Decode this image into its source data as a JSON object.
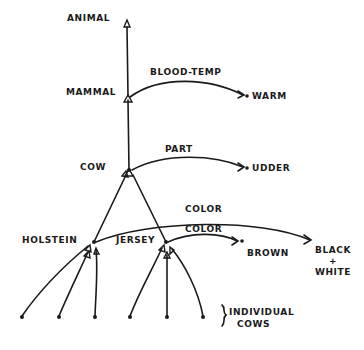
{
  "diagram": {
    "type": "semantic-network",
    "style": "hand-drawn",
    "nodes": {
      "animal": "ANIMAL",
      "mammal": "MAMMAL",
      "cow": "COW",
      "holstein": "HOLSTEIN",
      "jersey": "JERSEY",
      "warm": "WARM",
      "udder": "UDDER",
      "brown": "BROWN",
      "black_white": [
        "BLACK",
        "+",
        "WHITE"
      ],
      "individual_cows": [
        "INDIVIDUAL",
        "COWS"
      ]
    },
    "edges": {
      "blood_temp": "BLOOD-TEMP",
      "part": "PART",
      "color_holstein": "COLOR",
      "color_jersey": "COLOR"
    },
    "relations": [
      {
        "from": "MAMMAL",
        "to": "ANIMAL",
        "type": "is-a"
      },
      {
        "from": "COW",
        "to": "MAMMAL",
        "type": "is-a"
      },
      {
        "from": "HOLSTEIN",
        "to": "COW",
        "type": "is-a"
      },
      {
        "from": "JERSEY",
        "to": "COW",
        "type": "is-a"
      },
      {
        "from": "MAMMAL",
        "to": "WARM",
        "label": "BLOOD-TEMP"
      },
      {
        "from": "COW",
        "to": "UDDER",
        "label": "PART"
      },
      {
        "from": "HOLSTEIN",
        "to": "BLACK + WHITE",
        "label": "COLOR"
      },
      {
        "from": "JERSEY",
        "to": "BROWN",
        "label": "COLOR"
      }
    ],
    "colors": {
      "ink": "#1a1a1a",
      "background": "#ffffff"
    }
  }
}
